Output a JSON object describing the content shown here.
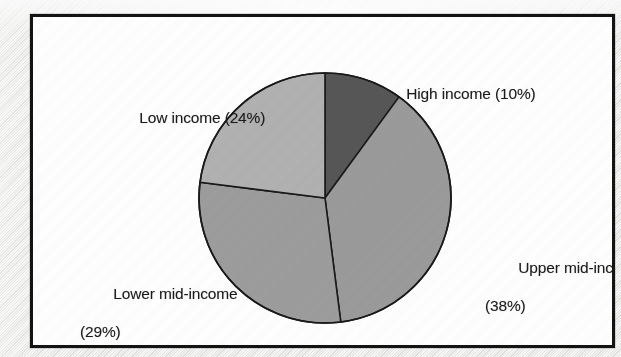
{
  "figure": {
    "frame_color": "#131313",
    "background_color": "#ffffff"
  },
  "chart_data": {
    "type": "pie",
    "title": "",
    "subtitle": "",
    "xlabel": "",
    "ylabel": "",
    "legend_position": "none",
    "labels_position": "outside-callout",
    "grid": false,
    "start_angle_deg": 0,
    "direction": "clockwise",
    "categories": [
      "High income",
      "Upper mid-income",
      "Lower mid-income",
      "Low income"
    ],
    "values": [
      10,
      38,
      29,
      24
    ],
    "units": "percent",
    "total": 101,
    "slices": [
      {
        "name": "High income",
        "value": 10,
        "value_text": "(10%)",
        "label_text": "High income (10%)",
        "label_lines": [
          "High income (10%)"
        ],
        "color": "#575757",
        "edge_color": "#1a1a1a",
        "start_deg": 0,
        "end_deg": 36
      },
      {
        "name": "Upper mid-income",
        "value": 38,
        "value_text": "(38%)",
        "label_text": "Upper mid-income (38%)",
        "label_lines": [
          "Upper mid-income",
          "(38%)"
        ],
        "color": "#9b9b9b",
        "edge_color": "#1a1a1a",
        "start_deg": 36,
        "end_deg": 172.8
      },
      {
        "name": "Lower mid-income",
        "value": 29,
        "value_text": "(29%)",
        "label_text": "Lower mid-income (29%)",
        "label_lines": [
          "Lower mid-income",
          "(29%)"
        ],
        "color": "#9d9d9d",
        "edge_color": "#1a1a1a",
        "start_deg": 172.8,
        "end_deg": 277.2
      },
      {
        "name": "Low income",
        "value": 24,
        "value_text": "(24%)",
        "label_text": "Low income (24%)",
        "label_lines": [
          "Low income (24%)"
        ],
        "color": "#b2b2b2",
        "edge_color": "#1a1a1a",
        "start_deg": 277.2,
        "end_deg": 360
      }
    ],
    "geometry": {
      "center_x": 292,
      "center_y": 181,
      "radius_x": 126,
      "radius_y": 125
    }
  },
  "labels": {
    "high_income": "High income (10%)",
    "low_income": "Low income (24%)",
    "upper_mid_income_line1": "Upper mid-income",
    "upper_mid_income_line2": "(38%)",
    "lower_mid_income_line1": "Lower mid-income",
    "lower_mid_income_line2": "(29%)"
  }
}
